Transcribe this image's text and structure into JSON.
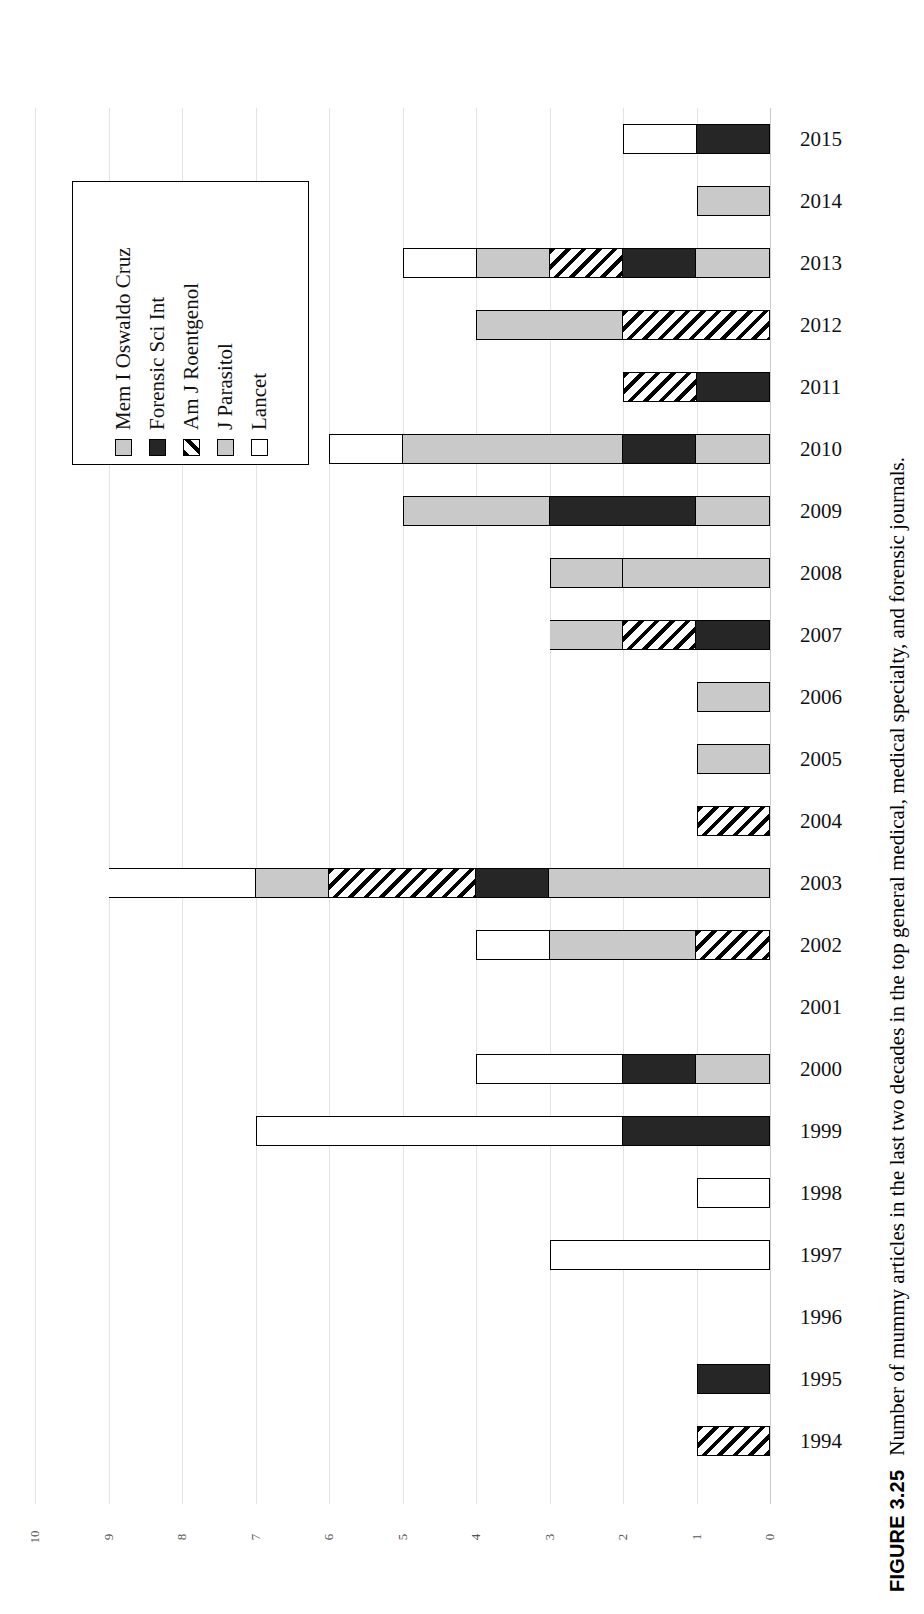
{
  "caption": {
    "figure_number": "FIGURE 3.25",
    "text": "Number of mummy articles in the last two decades in the top general medical, medical specialty, and forensic journals."
  },
  "legend": {
    "items": [
      {
        "label": "Mem I Oswaldo Cruz",
        "fill": "light-gray",
        "color": "#c9c9c9"
      },
      {
        "label": "Forensic Sci Int",
        "fill": "dark",
        "color": "#262626"
      },
      {
        "label": "Am J Roentgenol",
        "fill": "diagonal-hatch",
        "color": "#000000"
      },
      {
        "label": "J Parasitol",
        "fill": "light-gray",
        "color": "#c9c9c9"
      },
      {
        "label": "Lancet",
        "fill": "white",
        "color": "#ffffff"
      }
    ]
  },
  "chart_data": {
    "type": "bar",
    "orientation": "horizontal-stacked",
    "title": "",
    "xlabel": "",
    "ylabel": "",
    "xlim": [
      0,
      10
    ],
    "x_ticks": [
      "10",
      "9",
      "8",
      "7",
      "6",
      "5",
      "4",
      "3",
      "2",
      "1",
      "0"
    ],
    "x_axis_reversed": true,
    "grid": true,
    "legend_position": "inside-upper-left",
    "categories": [
      "2015",
      "2014",
      "2013",
      "2012",
      "2011",
      "2010",
      "2009",
      "2008",
      "2007",
      "2006",
      "2005",
      "2004",
      "2003",
      "2002",
      "2001",
      "2000",
      "1999",
      "1998",
      "1997",
      "1996",
      "1995",
      "1994"
    ],
    "series": [
      {
        "name": "Mem I Oswaldo Cruz",
        "values": [
          0,
          0,
          1,
          0,
          0,
          1,
          1,
          2,
          0,
          0,
          0,
          0,
          3,
          0,
          0,
          1,
          0,
          0,
          0,
          0,
          0,
          0
        ]
      },
      {
        "name": "Forensic Sci Int",
        "values": [
          1,
          0,
          1,
          0,
          1,
          1,
          2,
          0,
          1,
          0,
          0,
          0,
          1,
          0,
          0,
          1,
          2,
          0,
          0,
          0,
          1,
          0
        ]
      },
      {
        "name": "Am J Roentgenol",
        "values": [
          0,
          0,
          1,
          2,
          1,
          0,
          0,
          0,
          1,
          0,
          0,
          1,
          2,
          1,
          0,
          0,
          0,
          0,
          0,
          0,
          0,
          1
        ]
      },
      {
        "name": "J Parasitol",
        "values": [
          0,
          1,
          1,
          2,
          0,
          3,
          2,
          1,
          1,
          1,
          1,
          0,
          1,
          2,
          0,
          0,
          0,
          0,
          0,
          0,
          0,
          0
        ]
      },
      {
        "name": "Lancet",
        "values": [
          1,
          0,
          1,
          0,
          0,
          1,
          0,
          0,
          0,
          0,
          0,
          0,
          2,
          1,
          0,
          2,
          5,
          1,
          3,
          0,
          0,
          0
        ]
      }
    ],
    "totals": [
      2,
      1,
      5,
      4,
      2,
      6,
      5,
      3,
      3,
      1,
      1,
      1,
      9,
      4,
      0,
      4,
      7,
      1,
      3,
      0,
      1,
      1
    ]
  }
}
